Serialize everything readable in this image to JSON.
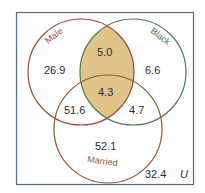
{
  "diagram": {
    "type": "venn",
    "universe_label": "U",
    "sets": [
      {
        "name": "Male",
        "color": "#a0463c"
      },
      {
        "name": "Black",
        "color": "#4e7a56"
      },
      {
        "name": "Married",
        "color": "#8a5a3a"
      }
    ],
    "regions": {
      "male_only": "26.9",
      "black_only": "6.6",
      "male_black_only": "5.0",
      "male_black_married": "4.3",
      "male_married_only": "51.6",
      "black_married_only": "4.7",
      "married_only": "52.1",
      "none": "32.4"
    },
    "highlight": {
      "region": "Male ∩ Black",
      "color": "#e2c48a"
    },
    "frame_color": "#5a6a84"
  }
}
